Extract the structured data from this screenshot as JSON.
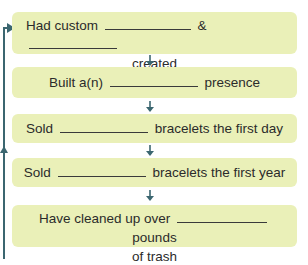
{
  "diagram": {
    "type": "flowchart",
    "colors": {
      "box_fill": "#eaf0b8",
      "arrow": "#3b6670",
      "text": "#2b2b2b"
    },
    "steps": [
      {
        "line1_before": "Had custom",
        "line1_mid": "&",
        "line2": "created"
      },
      {
        "before": "Built a(n)",
        "after": "presence"
      },
      {
        "before": "Sold",
        "after": "bracelets the first day"
      },
      {
        "before": "Sold",
        "after": "bracelets the first year"
      },
      {
        "before": "Have cleaned up over",
        "after": "pounds",
        "line2": "of trash"
      }
    ],
    "feedback_loop": "arrow from bottom back to first step"
  }
}
